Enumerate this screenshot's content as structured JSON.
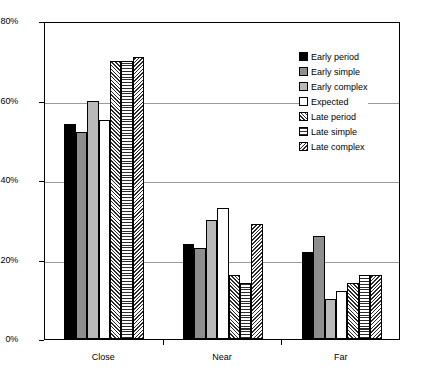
{
  "chart_data": {
    "type": "bar",
    "title": "",
    "subtitle": "",
    "xlabel": "",
    "ylabel": "",
    "categories": [
      "Close",
      "Near",
      "Far"
    ],
    "ylim": [
      0,
      80
    ],
    "yticks": [
      0,
      20,
      40,
      60,
      80
    ],
    "ytick_labels": [
      "0%",
      "20%",
      "40%",
      "60%",
      "80%"
    ],
    "grid": true,
    "legend_position": "top-right",
    "value_unit": "%",
    "series": [
      {
        "name": "Early period",
        "pattern": "solid-black",
        "color": "#000000",
        "values": [
          54,
          24,
          22
        ]
      },
      {
        "name": "Early simple",
        "pattern": "solid-gray-mid",
        "color": "#8e8e8e",
        "values": [
          52,
          23,
          26
        ]
      },
      {
        "name": "Early complex",
        "pattern": "solid-gray-light",
        "color": "#b9b9b9",
        "values": [
          60,
          30,
          10
        ]
      },
      {
        "name": "Expected",
        "pattern": "solid-white",
        "color": "#ffffff",
        "values": [
          55,
          33,
          12
        ]
      },
      {
        "name": "Late period",
        "pattern": "diagonal-forward-hatch",
        "color": "#2b2b2b",
        "values": [
          70,
          16,
          14
        ]
      },
      {
        "name": "Late simple",
        "pattern": "horizontal-lines",
        "color": "#2b2b2b",
        "values": [
          70,
          14,
          16
        ]
      },
      {
        "name": "Late complex",
        "pattern": "diagonal-backward-hatch",
        "color": "#2b2b2b",
        "values": [
          71,
          29,
          16
        ]
      }
    ]
  },
  "legend": {
    "items": [
      {
        "label": "Early period"
      },
      {
        "label": "Early simple"
      },
      {
        "label": "Early complex"
      },
      {
        "label": "Expected"
      },
      {
        "label": "Late period"
      },
      {
        "label": "Late simple"
      },
      {
        "label": "Late complex"
      }
    ]
  },
  "axes": {
    "y": {
      "tick_labels": [
        "80%",
        "60%",
        "40%",
        "20%",
        "0%"
      ]
    },
    "x": {
      "tick_labels": [
        "Close",
        "Near",
        "Far"
      ]
    }
  }
}
